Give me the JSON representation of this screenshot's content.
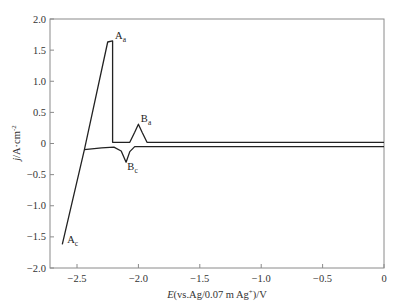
{
  "chart_data": {
    "type": "line",
    "title": "",
    "xlabel": "E(vs.Ag/0.07 m Ag+)/V",
    "xlabel_parts": {
      "italic": "E",
      "rest": "(vs.Ag/0.07 m Ag",
      "sup": "+",
      "tail": ")/V"
    },
    "ylabel": "j/A·cm^-2",
    "ylabel_parts": {
      "italic": "j",
      "rest": "/A·cm",
      "sup": "-2"
    },
    "xlim": [
      -2.72,
      0
    ],
    "ylim": [
      -2.0,
      2.0
    ],
    "xticks": [
      -2.5,
      -2.0,
      -1.5,
      -1.0,
      -0.5,
      0
    ],
    "xtick_labels": [
      "−2.5",
      "−2.0",
      "−1.5",
      "−1.0",
      "−0.5",
      "0"
    ],
    "yticks": [
      2.0,
      1.5,
      1.0,
      0.5,
      0,
      -0.5,
      -1.0,
      -1.5,
      -2.0
    ],
    "ytick_labels": [
      "2.0",
      "1.5",
      "1.0",
      "0.5",
      "0",
      "−0.5",
      "−1.0",
      "−1.5",
      "−2.0"
    ],
    "grid": false,
    "legend": null,
    "series": [
      {
        "name": "cyclic voltammogram",
        "color": "#222222",
        "x": [
          -2.62,
          -2.44,
          -2.25,
          -2.21,
          -2.21,
          -2.2,
          -2.1,
          -2.07,
          -2.03,
          -2.0,
          -1.97,
          -1.93,
          -1.9,
          -1.5,
          -1.0,
          -0.5,
          0.0
        ],
        "y": [
          -1.62,
          -0.1,
          1.63,
          1.65,
          0.02,
          0.02,
          0.02,
          0.02,
          0.18,
          0.31,
          0.18,
          0.02,
          0.02,
          0.02,
          0.02,
          0.02,
          0.02
        ]
      },
      {
        "name": "cathodic return branch",
        "color": "#222222",
        "x": [
          0.0,
          -0.5,
          -1.0,
          -1.5,
          -1.9,
          -2.03,
          -2.07,
          -2.1,
          -2.14,
          -2.2,
          -2.3,
          -2.44
        ],
        "y": [
          -0.05,
          -0.05,
          -0.05,
          -0.05,
          -0.05,
          -0.05,
          -0.13,
          -0.3,
          -0.12,
          -0.06,
          -0.07,
          -0.1
        ]
      }
    ],
    "annotations": [
      {
        "label": "A",
        "sub": "a",
        "x": -2.19,
        "y": 1.68
      },
      {
        "label": "B",
        "sub": "a",
        "x": -1.98,
        "y": 0.35
      },
      {
        "label": "B",
        "sub": "c",
        "x": -2.09,
        "y": -0.42
      },
      {
        "label": "A",
        "sub": "c",
        "x": -2.58,
        "y": -1.6
      }
    ]
  }
}
